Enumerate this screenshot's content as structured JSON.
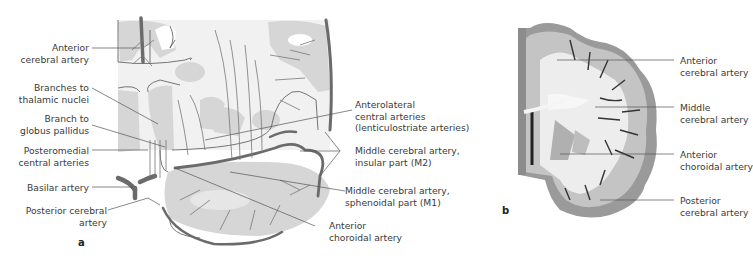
{
  "figure": {
    "panel_a": {
      "letter": "a",
      "labels": {
        "anterior_cerebral_artery": [
          "Anterior",
          "cerebral artery"
        ],
        "branches_to_thalamic_nuclei": [
          "Branches to",
          "thalamic nuclei"
        ],
        "branch_to_globus_pallidus": [
          "Branch to",
          "globus pallidus"
        ],
        "posteromedial_central_arteries": [
          "Posteromedial",
          "central arteries"
        ],
        "basilar_artery": [
          "Basilar artery"
        ],
        "posterior_cerebral_artery": [
          "Posterior cerebral",
          "artery"
        ],
        "anterolateral_central_arteries": [
          "Anterolateral",
          "central arteries",
          "(lenticulostriate arteries)"
        ],
        "mca_insular": [
          "Middle cerebral artery,",
          "insular part (M2)"
        ],
        "mca_sphenoidal": [
          "Middle cerebral artery,",
          "sphenoidal part (M1)"
        ],
        "anterior_choroidal_artery": [
          "Anterior",
          "choroidal artery"
        ]
      }
    },
    "panel_b": {
      "letter": "b",
      "labels": {
        "anterior_cerebral_artery": [
          "Anterior",
          "cerebral artery"
        ],
        "middle_cerebral_artery": [
          "Middle",
          "cerebral artery"
        ],
        "anterior_choroidal_artery": [
          "Anterior",
          "choroidal artery"
        ],
        "posterior_cerebral_artery": [
          "Posterior",
          "cerebral artery"
        ]
      }
    },
    "colors": {
      "artery": "#6b6b6b",
      "territory_fill": "#d9d9d9",
      "tissue_light": "#efefef",
      "leader_line": "#555555",
      "cortex_gray": "#a8a8a8",
      "white_matter": "#ececec"
    }
  }
}
